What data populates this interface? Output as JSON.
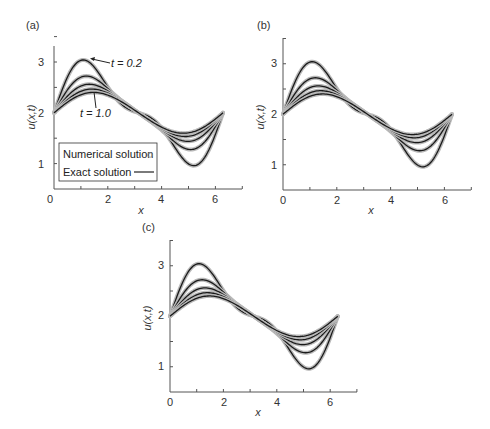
{
  "chart_data": [
    {
      "type": "line",
      "panel": "(a)",
      "xlabel": "x",
      "ylabel": "u(x,t)",
      "xlim": [
        0,
        7
      ],
      "ylim": [
        0.6,
        3.5
      ],
      "xticks": [
        0,
        2,
        4,
        6
      ],
      "yticks": [
        1,
        2,
        3
      ],
      "x_range": [
        0,
        6.2832
      ],
      "grid": false,
      "legend": {
        "position": "lower left",
        "entries": [
          {
            "label": "Numerical solution",
            "marker": "circle"
          },
          {
            "label": "Exact solution",
            "marker": "line"
          }
        ]
      },
      "annotations": [
        {
          "text": "t = 0.2",
          "x": 2.7,
          "y": 2.92
        },
        {
          "text": "t = 1.0",
          "x": 1.2,
          "y": 1.85
        }
      ],
      "series": [
        {
          "name": "t=0.2",
          "a": 0.85,
          "b": 0.35
        },
        {
          "name": "t=0.4",
          "a": 0.66,
          "b": 0.16
        },
        {
          "name": "t=0.6",
          "a": 0.54,
          "b": 0.08
        },
        {
          "name": "t=0.8",
          "a": 0.46,
          "b": 0.04
        },
        {
          "name": "t=1.0",
          "a": 0.4,
          "b": 0.02
        }
      ],
      "model": "u = 2 + a*sin(x) + b*sin(2x)"
    },
    {
      "type": "line",
      "panel": "(b)",
      "xlabel": "x",
      "ylabel": "u(x,t)",
      "xlim": [
        0,
        7
      ],
      "ylim": [
        0.6,
        3.5
      ],
      "xticks": [
        0,
        2,
        4,
        6
      ],
      "yticks": [
        1,
        2,
        3
      ],
      "x_range": [
        0,
        6.2832
      ],
      "grid": false,
      "series": [
        {
          "name": "t=0.2",
          "a": 0.85,
          "b": 0.35
        },
        {
          "name": "t=0.4",
          "a": 0.66,
          "b": 0.16
        },
        {
          "name": "t=0.6",
          "a": 0.54,
          "b": 0.08
        },
        {
          "name": "t=0.8",
          "a": 0.46,
          "b": 0.04
        },
        {
          "name": "t=1.0",
          "a": 0.4,
          "b": 0.02
        }
      ]
    },
    {
      "type": "line",
      "panel": "(c)",
      "xlabel": "x",
      "ylabel": "u(x,t)",
      "xlim": [
        0,
        7
      ],
      "ylim": [
        0.6,
        3.5
      ],
      "xticks": [
        0,
        2,
        4,
        6
      ],
      "yticks": [
        1,
        2,
        3
      ],
      "x_range": [
        0,
        6.2832
      ],
      "grid": false,
      "series": [
        {
          "name": "t=0.2",
          "a": 0.85,
          "b": 0.35
        },
        {
          "name": "t=0.4",
          "a": 0.66,
          "b": 0.16
        },
        {
          "name": "t=0.6",
          "a": 0.54,
          "b": 0.08
        },
        {
          "name": "t=0.8",
          "a": 0.46,
          "b": 0.04
        },
        {
          "name": "t=1.0",
          "a": 0.4,
          "b": 0.02
        }
      ]
    }
  ],
  "panels": [
    {
      "label": "(a)",
      "ox": 54,
      "oy": 189,
      "sx": 26.9,
      "sy": 50.8,
      "axisTop": 46,
      "axisRight": 242
    },
    {
      "label": "(b)",
      "ox": 283,
      "oy": 190,
      "sx": 26.9,
      "sy": 50.5,
      "axisTop": 38,
      "axisRight": 471
    },
    {
      "label": "(c)",
      "ox": 170,
      "oy": 392,
      "sx": 26.7,
      "sy": 50.5,
      "axisTop": 240,
      "axisRight": 357
    }
  ],
  "labels": {
    "a": "(a)",
    "b": "(b)",
    "c": "(c)",
    "xlabel": "x",
    "ylabel": "u(x,t)",
    "t_top": "t = 0.2",
    "t_bottom": "t = 1.0",
    "legend_numerical": "Numerical solution",
    "legend_exact": "Exact solution",
    "ticks": {
      "x0": "0",
      "x2": "2",
      "x4": "4",
      "x6": "6",
      "y1": "1",
      "y2": "2",
      "y3": "3"
    }
  }
}
